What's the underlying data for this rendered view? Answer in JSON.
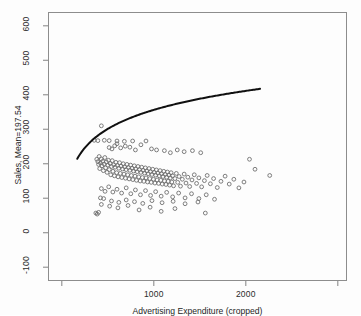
{
  "chart_data": {
    "type": "scatter",
    "title": "",
    "subtitle": "",
    "ylabel": "Sales, Mean=197.54",
    "xlabel": "Advertising Expenditure (cropped)",
    "xlim": [
      -150,
      3100
    ],
    "ylim": [
      -140,
      640
    ],
    "grid": false,
    "legend": null,
    "y_ticks": [
      -100,
      0,
      100,
      200,
      300,
      400,
      500,
      600
    ],
    "y_tick_labels": [
      "-100",
      "0",
      "100",
      "200",
      "300",
      "400",
      "500",
      "600"
    ],
    "x_ticks": [
      0,
      1000,
      2000,
      3000
    ],
    "x_tick_labels": [
      "",
      "1000",
      "2000",
      ""
    ],
    "mean_y": 197.54,
    "point_style": {
      "marker": "open-circle",
      "radius_px": 1.9,
      "color": "#6f6f6f"
    },
    "curve": {
      "name": "fitted log curve",
      "color": "#101010",
      "width_px": 2.0,
      "x_start": 168,
      "x_end": 2155,
      "y_start": 45,
      "y_end": 421,
      "form": "a + b*ln(x)",
      "a": -193.0,
      "b": 79.5
    },
    "points": [
      [
        352,
        268
      ],
      [
        392,
        267
      ],
      [
        462,
        268
      ],
      [
        515,
        267
      ],
      [
        600,
        266
      ],
      [
        680,
        265
      ],
      [
        770,
        266
      ],
      [
        430,
        310
      ],
      [
        515,
        247
      ],
      [
        545,
        243
      ],
      [
        575,
        252
      ],
      [
        600,
        258
      ],
      [
        640,
        246
      ],
      [
        690,
        251
      ],
      [
        740,
        248
      ],
      [
        800,
        240
      ],
      [
        860,
        255
      ],
      [
        915,
        266
      ],
      [
        975,
        243
      ],
      [
        1030,
        240
      ],
      [
        1115,
        238
      ],
      [
        1180,
        232
      ],
      [
        1255,
        240
      ],
      [
        1330,
        235
      ],
      [
        1420,
        238
      ],
      [
        1510,
        232
      ],
      [
        380,
        213
      ],
      [
        392,
        206
      ],
      [
        400,
        198
      ],
      [
        406,
        221
      ],
      [
        412,
        186
      ],
      [
        420,
        202
      ],
      [
        428,
        214
      ],
      [
        436,
        194
      ],
      [
        444,
        207
      ],
      [
        452,
        180
      ],
      [
        460,
        199
      ],
      [
        468,
        218
      ],
      [
        476,
        188
      ],
      [
        484,
        205
      ],
      [
        492,
        175
      ],
      [
        500,
        196
      ],
      [
        508,
        210
      ],
      [
        516,
        183
      ],
      [
        524,
        201
      ],
      [
        532,
        168
      ],
      [
        540,
        192
      ],
      [
        548,
        209
      ],
      [
        556,
        178
      ],
      [
        564,
        197
      ],
      [
        572,
        165
      ],
      [
        580,
        190
      ],
      [
        588,
        204
      ],
      [
        596,
        174
      ],
      [
        604,
        195
      ],
      [
        612,
        162
      ],
      [
        620,
        187
      ],
      [
        628,
        203
      ],
      [
        636,
        172
      ],
      [
        644,
        193
      ],
      [
        652,
        160
      ],
      [
        660,
        185
      ],
      [
        668,
        200
      ],
      [
        676,
        170
      ],
      [
        684,
        191
      ],
      [
        692,
        158
      ],
      [
        700,
        183
      ],
      [
        708,
        198
      ],
      [
        716,
        168
      ],
      [
        724,
        189
      ],
      [
        732,
        156
      ],
      [
        740,
        181
      ],
      [
        748,
        196
      ],
      [
        756,
        166
      ],
      [
        764,
        187
      ],
      [
        772,
        154
      ],
      [
        780,
        179
      ],
      [
        788,
        194
      ],
      [
        796,
        164
      ],
      [
        804,
        185
      ],
      [
        812,
        152
      ],
      [
        820,
        177
      ],
      [
        828,
        192
      ],
      [
        836,
        162
      ],
      [
        844,
        183
      ],
      [
        852,
        150
      ],
      [
        860,
        175
      ],
      [
        868,
        190
      ],
      [
        876,
        160
      ],
      [
        884,
        181
      ],
      [
        892,
        149
      ],
      [
        900,
        173
      ],
      [
        908,
        188
      ],
      [
        916,
        159
      ],
      [
        924,
        179
      ],
      [
        932,
        147
      ],
      [
        940,
        171
      ],
      [
        948,
        186
      ],
      [
        956,
        157
      ],
      [
        964,
        177
      ],
      [
        972,
        146
      ],
      [
        980,
        169
      ],
      [
        988,
        184
      ],
      [
        996,
        155
      ],
      [
        1004,
        175
      ],
      [
        1012,
        144
      ],
      [
        1020,
        167
      ],
      [
        1028,
        182
      ],
      [
        1036,
        153
      ],
      [
        1044,
        173
      ],
      [
        1052,
        143
      ],
      [
        1060,
        165
      ],
      [
        1068,
        180
      ],
      [
        1076,
        152
      ],
      [
        1084,
        171
      ],
      [
        1092,
        141
      ],
      [
        1100,
        163
      ],
      [
        1108,
        178
      ],
      [
        1116,
        150
      ],
      [
        1124,
        169
      ],
      [
        1132,
        140
      ],
      [
        1140,
        161
      ],
      [
        1148,
        176
      ],
      [
        1156,
        149
      ],
      [
        1164,
        167
      ],
      [
        1172,
        138
      ],
      [
        1180,
        159
      ],
      [
        1188,
        174
      ],
      [
        1196,
        147
      ],
      [
        1204,
        165
      ],
      [
        1215,
        136
      ],
      [
        1230,
        157
      ],
      [
        1245,
        172
      ],
      [
        1260,
        146
      ],
      [
        1275,
        163
      ],
      [
        1290,
        135
      ],
      [
        1310,
        155
      ],
      [
        1330,
        170
      ],
      [
        1350,
        144
      ],
      [
        1370,
        161
      ],
      [
        1390,
        134
      ],
      [
        1415,
        153
      ],
      [
        1440,
        168
      ],
      [
        1465,
        143
      ],
      [
        1490,
        159
      ],
      [
        1520,
        133
      ],
      [
        1550,
        151
      ],
      [
        1580,
        166
      ],
      [
        1615,
        142
      ],
      [
        1650,
        157
      ],
      [
        1690,
        131
      ],
      [
        1730,
        149
      ],
      [
        1775,
        164
      ],
      [
        1820,
        141
      ],
      [
        1870,
        155
      ],
      [
        1925,
        130
      ],
      [
        1980,
        147
      ],
      [
        2040,
        213
      ],
      [
        2100,
        184
      ],
      [
        2260,
        166
      ],
      [
        430,
        128
      ],
      [
        470,
        120
      ],
      [
        510,
        133
      ],
      [
        555,
        118
      ],
      [
        600,
        126
      ],
      [
        650,
        115
      ],
      [
        700,
        130
      ],
      [
        750,
        113
      ],
      [
        800,
        124
      ],
      [
        855,
        110
      ],
      [
        910,
        122
      ],
      [
        965,
        108
      ],
      [
        1020,
        119
      ],
      [
        1080,
        106
      ],
      [
        1140,
        117
      ],
      [
        1205,
        104
      ],
      [
        1270,
        115
      ],
      [
        1340,
        101
      ],
      [
        1410,
        113
      ],
      [
        1490,
        99
      ],
      [
        1570,
        110
      ],
      [
        1660,
        97
      ],
      [
        420,
        101
      ],
      [
        455,
        99
      ],
      [
        540,
        92
      ],
      [
        620,
        88
      ],
      [
        700,
        95
      ],
      [
        790,
        90
      ],
      [
        880,
        85
      ],
      [
        980,
        93
      ],
      [
        1090,
        87
      ],
      [
        1210,
        91
      ],
      [
        1340,
        84
      ],
      [
        1480,
        89
      ],
      [
        1560,
        57
      ],
      [
        370,
        57
      ],
      [
        385,
        54
      ],
      [
        400,
        59
      ],
      [
        430,
        82
      ],
      [
        520,
        77
      ],
      [
        610,
        72
      ],
      [
        720,
        79
      ],
      [
        840,
        66
      ],
      [
        960,
        74
      ],
      [
        1080,
        62
      ],
      [
        1230,
        70
      ]
    ]
  }
}
